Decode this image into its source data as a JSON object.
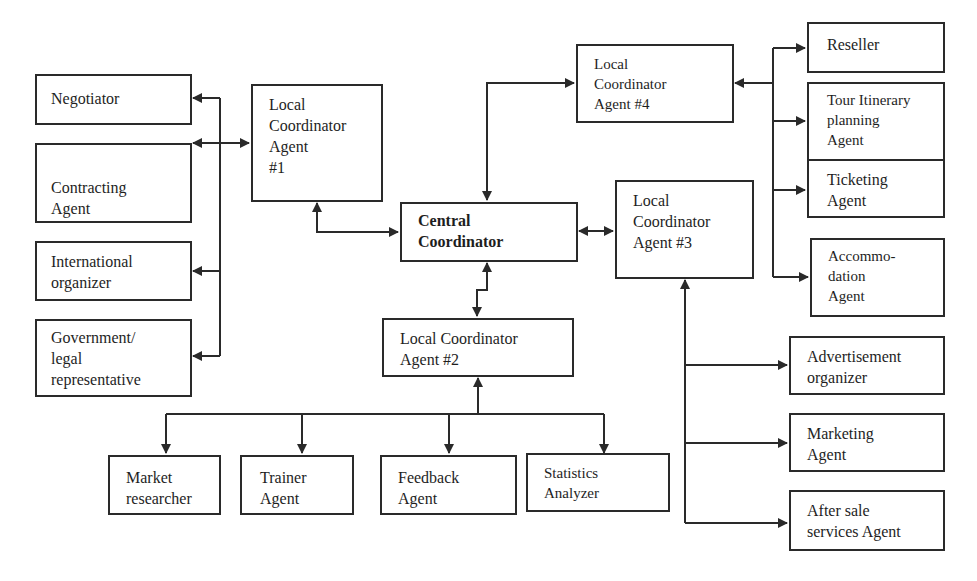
{
  "diagram": {
    "type": "multi-agent architecture",
    "colors": {
      "line": "#2a2a2a",
      "text": "#1e1e1e",
      "background": "#ffffff"
    },
    "nodes": {
      "central": {
        "label": "Central\nCoordinator"
      },
      "lca1": {
        "label": "Local\nCoordinator\nAgent\n#1"
      },
      "lca2": {
        "label": "Local Coordinator\nAgent #2"
      },
      "lca3": {
        "label": "Local\nCoordinator\nAgent #3"
      },
      "lca4": {
        "label": "Local\nCoordinator\nAgent #4"
      },
      "negotiator": {
        "label": "Negotiator"
      },
      "contracting": {
        "label": "Contracting\nAgent"
      },
      "international": {
        "label": "International\norganizer"
      },
      "government": {
        "label": "Government/\nlegal\nrepresentative"
      },
      "reseller": {
        "label": "Reseller"
      },
      "tour": {
        "label": "Tour Itinerary\nplanning\nAgent"
      },
      "ticketing": {
        "label": "Ticketing\nAgent"
      },
      "accommodation": {
        "label": "Accommo-\ndation\nAgent"
      },
      "market": {
        "label": "Market\nresearcher"
      },
      "trainer": {
        "label": "Trainer\nAgent"
      },
      "feedback": {
        "label": "Feedback\nAgent"
      },
      "statistics": {
        "label": "Statistics\nAnalyzer"
      },
      "advertisement": {
        "label": "Advertisement\norganizer"
      },
      "marketing": {
        "label": "Marketing\nAgent"
      },
      "aftersale": {
        "label": "After sale\nservices Agent"
      }
    },
    "edges": [
      {
        "from": "central",
        "to": "lca1",
        "bidirectional": true
      },
      {
        "from": "central",
        "to": "lca2",
        "bidirectional": true
      },
      {
        "from": "central",
        "to": "lca3",
        "bidirectional": true
      },
      {
        "from": "central",
        "to": "lca4",
        "bidirectional": true
      },
      {
        "from": "lca1",
        "to": "negotiator"
      },
      {
        "from": "lca1",
        "to": "contracting"
      },
      {
        "from": "lca1",
        "to": "international"
      },
      {
        "from": "lca1",
        "to": "government"
      },
      {
        "from": "lca4",
        "to": "reseller"
      },
      {
        "from": "lca4",
        "to": "tour"
      },
      {
        "from": "lca4",
        "to": "ticketing"
      },
      {
        "from": "lca4",
        "to": "accommodation"
      },
      {
        "from": "lca2",
        "to": "market"
      },
      {
        "from": "lca2",
        "to": "trainer"
      },
      {
        "from": "lca2",
        "to": "feedback"
      },
      {
        "from": "lca2",
        "to": "statistics"
      },
      {
        "from": "lca3",
        "to": "advertisement"
      },
      {
        "from": "lca3",
        "to": "marketing"
      },
      {
        "from": "lca3",
        "to": "aftersale"
      }
    ]
  }
}
